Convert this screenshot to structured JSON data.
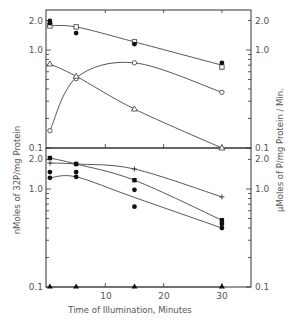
{
  "chart_data": [
    {
      "type": "line",
      "panel": "top",
      "yscale": "log",
      "x_label": "Time of Illumination, Minutes",
      "ylabel_left": "nMoles of 32P/mg Protein",
      "ylabel_right": "µMoles of P/mg Protein / Min.",
      "xlim": [
        0,
        35
      ],
      "ylim": [
        0.1,
        2.5
      ],
      "y_tick_labels": [
        "2.0",
        "1.0",
        "0.1"
      ],
      "grid": false,
      "series": [
        {
          "name": "open square",
          "marker": "open-square",
          "x": [
            0.5,
            5,
            15,
            30
          ],
          "values": [
            1.76,
            1.72,
            1.21,
            0.67
          ]
        },
        {
          "name": "filled circle",
          "marker": "filled-circle",
          "x": [
            0.5,
            0.5,
            5,
            15,
            30
          ],
          "values": [
            1.98,
            1.88,
            1.49,
            1.15,
            0.74
          ]
        },
        {
          "name": "open circle",
          "marker": "open-circle",
          "x": [
            0.5,
            5,
            15,
            30
          ],
          "values": [
            0.15,
            0.51,
            0.74,
            0.37
          ]
        },
        {
          "name": "open triangle",
          "marker": "open-triangle",
          "x": [
            0.5,
            5,
            15,
            30
          ],
          "values": [
            0.72,
            0.54,
            0.25,
            0.1
          ]
        }
      ]
    },
    {
      "type": "line",
      "panel": "bottom",
      "yscale": "log",
      "x_label": "Time of Illumination, Minutes",
      "ylabel_left": "nMoles of 32P/mg Protein",
      "ylabel_right": "µMoles of P/mg Protein / Min.",
      "xlim": [
        0,
        35
      ],
      "ylim": [
        0.1,
        2.5
      ],
      "x_tick_labels": [
        "10",
        "20",
        "30"
      ],
      "y_tick_labels": [
        "2.0",
        "1.0",
        "0.1"
      ],
      "grid": false,
      "series": [
        {
          "name": "plus",
          "marker": "plus",
          "x": [
            0.5,
            5,
            15,
            30
          ],
          "values": [
            1.84,
            1.8,
            1.6,
            0.83
          ]
        },
        {
          "name": "filled square",
          "marker": "filled-square",
          "x": [
            0.5,
            5,
            15,
            30
          ],
          "values": [
            2.07,
            1.8,
            1.23,
            0.48
          ]
        },
        {
          "name": "filled circle",
          "marker": "filled-circle",
          "x": [
            0.5,
            0.5,
            5,
            5,
            15,
            15,
            30,
            30
          ],
          "values": [
            1.49,
            1.3,
            1.49,
            1.33,
            0.98,
            0.66,
            0.44,
            0.4
          ]
        },
        {
          "name": "filled triangle",
          "marker": "filled-triangle",
          "x": [
            0.5,
            5,
            15,
            30
          ],
          "values": [
            0.1,
            0.1,
            0.1,
            0.1
          ]
        }
      ]
    }
  ],
  "labels": {
    "x_axis_title": "Time of Illumination, Minutes",
    "y_left_title": "nMoles of 32P/mg Protein",
    "y_right_title": "µMoles of P/mg Protein / Min.",
    "x_ticks": [
      "10",
      "20",
      "30"
    ],
    "top_left_ticks": [
      "2.0",
      "1.0",
      "0.1"
    ],
    "top_right_ticks": [
      "2.0",
      "1.0",
      "0.1"
    ],
    "bottom_left_ticks": [
      "2.0",
      "1.0",
      "0.1"
    ],
    "bottom_right_ticks": [
      "2.0",
      "1.0",
      "0.1"
    ]
  }
}
